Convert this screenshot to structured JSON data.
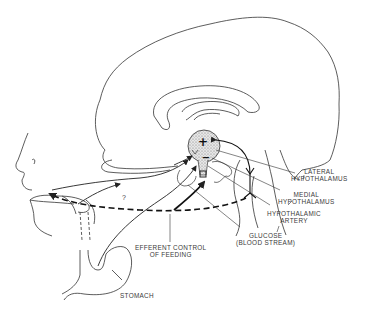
{
  "diagram": {
    "labels": {
      "lateral_hypothalamus": [
        "LATERAL",
        "HYPOTHALAMUS"
      ],
      "medial_hypothalamus": [
        "MEDIAL",
        "HYPOTHALAMUS"
      ],
      "hypothalamic_artery": [
        "HYPOTHALAMIC",
        "ARTERY"
      ],
      "glucose": [
        "GLUCOSE",
        "(BLOOD STREAM)"
      ],
      "efferent_control": [
        "EFFERENT CONTROL",
        "OF FEEDING"
      ],
      "stomach": "STOMACH",
      "question_mark": "?",
      "plus_sign": "+",
      "minus_sign": "−"
    },
    "colors": {
      "line": "#222222",
      "text": "#3a3a3a",
      "hypothalamus_fill": "#cfcfcf"
    }
  }
}
